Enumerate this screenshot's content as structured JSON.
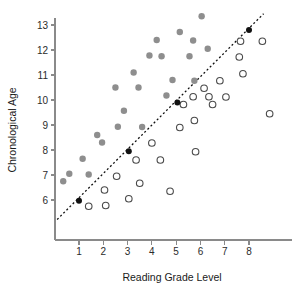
{
  "chart_data": {
    "type": "scatter",
    "title": "",
    "xlabel": "Reading Grade Level",
    "ylabel": "Chronological Age",
    "xlim": [
      0,
      9.6
    ],
    "ylim": [
      5.2,
      13.6
    ],
    "xticks": [
      1,
      2,
      3,
      4,
      5,
      6,
      7,
      8
    ],
    "yticks": [
      6,
      7,
      8,
      9,
      10,
      11,
      12,
      13
    ],
    "xtick_labels": [
      "1",
      "2",
      "3",
      "4",
      "5",
      "6",
      "7",
      "8"
    ],
    "ytick_labels": [
      "6",
      "7",
      "8",
      "9",
      "10",
      "11",
      "12",
      "13"
    ],
    "grid": false,
    "legend": "none",
    "colors": {
      "filled_gray": "#8e8e8e",
      "open_marker_stroke": "#4a4a4a",
      "diagonal_marker": "#111111",
      "axis": "#8a8a8a",
      "text": "#1a1a1a"
    },
    "reference_line": {
      "name": "identity-reference-line",
      "style": "dotted",
      "x_start": 0.1,
      "y_start": 5.22,
      "x_end": 8.6,
      "y_end": 13.45
    },
    "series": [
      {
        "name": "Above reference line (filled gray)",
        "marker": "filled-circle",
        "color": "#8e8e8e",
        "points": [
          [
            0.35,
            6.75
          ],
          [
            0.6,
            7.05
          ],
          [
            1.15,
            7.65
          ],
          [
            1.4,
            7.02
          ],
          [
            1.75,
            8.6
          ],
          [
            1.95,
            8.3
          ],
          [
            2.5,
            10.5
          ],
          [
            2.6,
            8.93
          ],
          [
            2.85,
            9.57
          ],
          [
            3.25,
            11.1
          ],
          [
            3.45,
            10.5
          ],
          [
            3.6,
            8.92
          ],
          [
            3.9,
            11.78
          ],
          [
            4.4,
            11.75
          ],
          [
            4.2,
            12.4
          ],
          [
            4.6,
            10.18
          ],
          [
            4.85,
            10.8
          ],
          [
            5.15,
            12.72
          ],
          [
            5.55,
            11.75
          ],
          [
            5.7,
            12.38
          ],
          [
            5.75,
            10.77
          ],
          [
            6.05,
            13.35
          ],
          [
            6.3,
            12.05
          ]
        ]
      },
      {
        "name": "Below reference line (open circles)",
        "marker": "open-circle",
        "color": "#ffffff",
        "points": [
          [
            1.4,
            5.75
          ],
          [
            2.05,
            6.4
          ],
          [
            2.1,
            5.78
          ],
          [
            2.55,
            6.95
          ],
          [
            3.05,
            6.05
          ],
          [
            3.35,
            7.6
          ],
          [
            3.5,
            6.67
          ],
          [
            4.0,
            8.28
          ],
          [
            4.35,
            7.6
          ],
          [
            4.75,
            6.35
          ],
          [
            5.15,
            8.9
          ],
          [
            5.3,
            9.82
          ],
          [
            5.7,
            10.13
          ],
          [
            5.75,
            9.18
          ],
          [
            5.8,
            7.93
          ],
          [
            6.15,
            10.47
          ],
          [
            6.35,
            10.13
          ],
          [
            6.5,
            9.82
          ],
          [
            6.8,
            10.77
          ],
          [
            7.05,
            10.12
          ],
          [
            7.6,
            11.72
          ],
          [
            7.65,
            12.35
          ],
          [
            7.75,
            11.05
          ],
          [
            8.55,
            12.35
          ],
          [
            8.85,
            9.45
          ]
        ]
      },
      {
        "name": "On reference line (solid black)",
        "marker": "filled-circle",
        "color": "#111111",
        "points": [
          [
            1.0,
            5.97
          ],
          [
            3.05,
            7.95
          ],
          [
            5.05,
            9.9
          ],
          [
            8.0,
            12.8
          ]
        ]
      }
    ]
  },
  "axes": {
    "y_title": "Chronological Age",
    "x_title": "Reading Grade Level"
  }
}
